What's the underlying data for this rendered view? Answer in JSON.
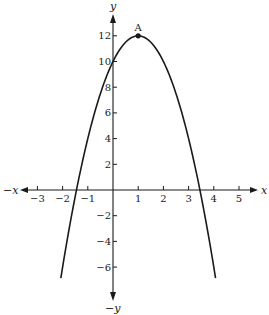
{
  "chart_data": {
    "type": "line",
    "title": "",
    "xlabel": "x",
    "ylabel": "y",
    "axis_labels": {
      "pos_x": "x",
      "neg_x": "−x",
      "pos_y": "y",
      "neg_y": "−y"
    },
    "xlim": [
      -4,
      5.5
    ],
    "ylim": [
      -8,
      13
    ],
    "x_ticks": [
      -3,
      -2,
      -1,
      1,
      2,
      3,
      4,
      5
    ],
    "x_tick_labels": [
      "−3",
      "−2",
      "−1",
      "1",
      "2",
      "3",
      "4",
      "5"
    ],
    "y_ticks": [
      12,
      10,
      8,
      6,
      4,
      2,
      -2,
      -4,
      -6
    ],
    "y_tick_labels": [
      "12",
      "10",
      "8",
      "6",
      "4",
      "2",
      "−2",
      "−4",
      "−6"
    ],
    "grid": false,
    "series": [
      {
        "name": "parabola",
        "equation": "y = -2x^2 + 4x + 10",
        "x": [
          -2.07,
          -1.5,
          -1,
          -0.5,
          0,
          0.5,
          1,
          1.5,
          2,
          2.5,
          3,
          3.5,
          4.07
        ],
        "y": [
          -6.8,
          -3.5,
          4,
          7.5,
          10,
          11.5,
          12,
          11.5,
          10,
          7.5,
          4,
          -0.5,
          -6.8
        ]
      }
    ],
    "annotations": [
      {
        "label": "A",
        "x": 1,
        "y": 12,
        "marker": "dot"
      }
    ],
    "roots_approx": [
      -1.45,
      3.45
    ],
    "y_intercept": 10,
    "vertex": [
      1,
      12
    ]
  },
  "colors": {
    "ink": "#1a1a1a",
    "background": "#ffffff"
  }
}
